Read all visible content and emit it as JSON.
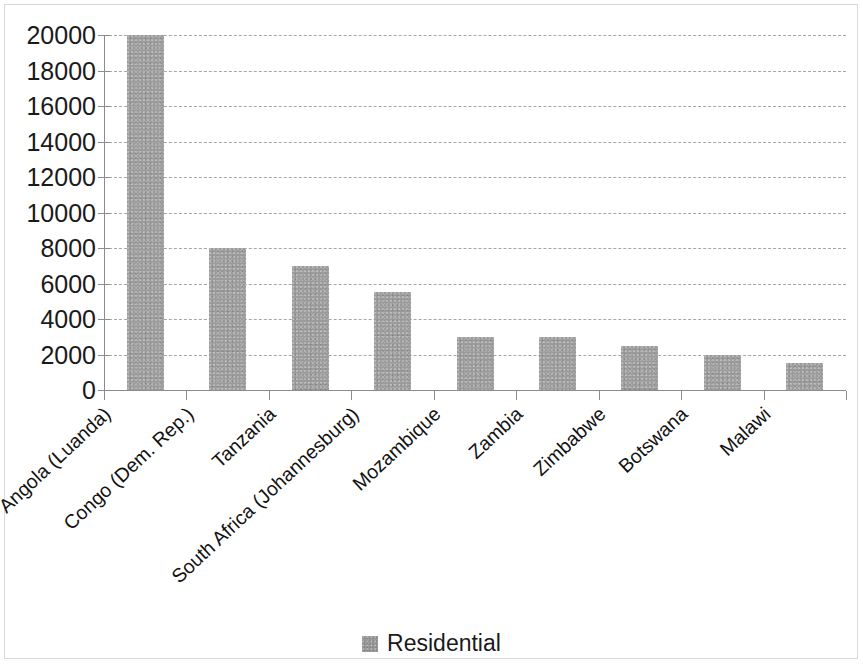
{
  "chart_data": {
    "type": "bar",
    "title": "",
    "subtitle": "",
    "xlabel": "",
    "ylabel": "",
    "categories": [
      "Angola (Luanda)",
      "Congo (Dem. Rep.)",
      "Tanzania",
      "South Africa (Johannesburg)",
      "Mozambique",
      "Zambia",
      "Zimbabwe",
      "Botswana",
      "Malawi"
    ],
    "series": [
      {
        "name": "Residential",
        "values": [
          20000,
          8000,
          7000,
          5500,
          3000,
          3000,
          2500,
          2000,
          1500
        ],
        "color": "#9b9b9b"
      }
    ],
    "ylim": [
      0,
      20000
    ],
    "ytick_step": 2000,
    "yticks": [
      0,
      2000,
      4000,
      6000,
      8000,
      10000,
      12000,
      14000,
      16000,
      18000,
      20000
    ],
    "ytick_labels": [
      "0",
      "2000",
      "4000",
      "6000",
      "8000",
      "10000",
      "12000",
      "14000",
      "16000",
      "18000",
      "20000"
    ],
    "grid": true,
    "grid_style": "dashed",
    "grid_axis": "y",
    "legend": {
      "position": "bottom",
      "entries": [
        {
          "label": "Residential",
          "color": "#9b9b9b",
          "swatch": "legend-swatch-square"
        }
      ]
    },
    "xtick_label_rotation": -43
  }
}
